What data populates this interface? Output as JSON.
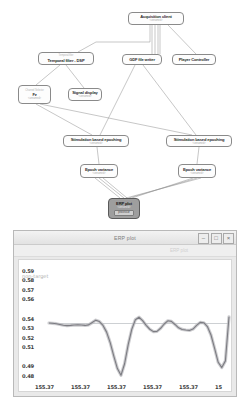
{
  "designer": {
    "nodes": [
      {
        "id": "acquisition-client",
        "sub_top": "",
        "title": "Acquisition client",
        "sub": "<unnamed>",
        "x": 128,
        "y": 12,
        "w": 56,
        "h": 13,
        "selected": false
      },
      {
        "id": "temporal-filter",
        "sub_top": "Temporal filter",
        "title": "Temporal filter - DSP",
        "sub": "",
        "x": 38,
        "y": 52,
        "w": 56,
        "h": 13,
        "selected": false
      },
      {
        "id": "gdf-file-writer",
        "sub_top": "",
        "title": "GDF file writer",
        "sub": "",
        "x": 122,
        "y": 54,
        "w": 40,
        "h": 11,
        "selected": false
      },
      {
        "id": "player-controller",
        "sub_top": "",
        "title": "Player Controller",
        "sub": "",
        "x": 172,
        "y": 54,
        "w": 44,
        "h": 11,
        "selected": false
      },
      {
        "id": "channel-selector",
        "sub_top": "Channel Selector",
        "title": "Fz",
        "sub": "<unnamed>",
        "x": 18,
        "y": 85,
        "w": 33,
        "h": 19,
        "selected": false
      },
      {
        "id": "signal-display",
        "sub_top": "",
        "title": "Signal display",
        "sub": "<unnamed>",
        "x": 68,
        "y": 88,
        "w": 34,
        "h": 13,
        "selected": false
      },
      {
        "id": "stim-epoching-left",
        "sub_top": "",
        "title": "Stimulation based epoching",
        "sub": "<unnamed>",
        "x": 63,
        "y": 135,
        "w": 66,
        "h": 12,
        "selected": false
      },
      {
        "id": "stim-epoching-right",
        "sub_top": "",
        "title": "Stimulation based epoching",
        "sub": "<unnamed>",
        "x": 166,
        "y": 135,
        "w": 66,
        "h": 12,
        "selected": false
      },
      {
        "id": "epoch-variance-left",
        "sub_top": "",
        "title": "Epoch variance",
        "sub": "<unnamed>",
        "x": 80,
        "y": 164,
        "w": 38,
        "h": 14,
        "selected": false
      },
      {
        "id": "epoch-variance-right",
        "sub_top": "",
        "title": "Epoch variance",
        "sub": "<unnamed>",
        "x": 178,
        "y": 164,
        "w": 38,
        "h": 14,
        "selected": false
      },
      {
        "id": "erp-plot-node",
        "sub_top": "",
        "title": "ERP plot",
        "sub": "<unnamed>",
        "chip": "processor",
        "x": 108,
        "y": 198,
        "w": 32,
        "h": 21,
        "selected": true
      }
    ]
  },
  "erp_window": {
    "title": "ERP plot",
    "tab_label": "ERP plot",
    "buttons": {
      "minimize": "–",
      "maximize": "□",
      "close": "×"
    }
  },
  "chart_data": {
    "type": "line",
    "title": "ERP plot",
    "xlabel": "",
    "ylabel": "",
    "legend": [
      "non-target"
    ],
    "legend_position": "top-left",
    "grid": false,
    "yticks": [
      "0.59",
      "0.58",
      "0.57",
      "0.56",
      "0.54",
      "0.53",
      "0.52",
      "0.51",
      "0.49",
      "0.48"
    ],
    "ytick_values": [
      0.59,
      0.58,
      0.57,
      0.56,
      0.54,
      0.53,
      0.52,
      0.51,
      0.49,
      0.48
    ],
    "ylim": [
      0.475,
      0.595
    ],
    "xticks": [
      "155.37",
      "155.37",
      "155.37",
      "155.37",
      "155.37",
      "15"
    ],
    "xtick_values": [
      155.37,
      155.37,
      155.37,
      155.37,
      155.37,
      155.37
    ],
    "baseline": 0.535,
    "series": [
      {
        "name": "non-target",
        "x": [
          0,
          2,
          4,
          6,
          8,
          10,
          12,
          14,
          16,
          18,
          20,
          22,
          24,
          26,
          28,
          30,
          32,
          34,
          36,
          38,
          40,
          42,
          44,
          46,
          48,
          50,
          52,
          54,
          56,
          58,
          60,
          62,
          64,
          66,
          68,
          70,
          72,
          74,
          76,
          78,
          80,
          82,
          84,
          86,
          88,
          90,
          92,
          94,
          96,
          98,
          100
        ],
        "values": [
          0.5355,
          0.5352,
          0.5348,
          0.534,
          0.5332,
          0.5328,
          0.533,
          0.5334,
          0.5336,
          0.5334,
          0.533,
          0.5336,
          0.536,
          0.5385,
          0.537,
          0.533,
          0.526,
          0.515,
          0.501,
          0.488,
          0.481,
          0.493,
          0.513,
          0.529,
          0.539,
          0.5415,
          0.538,
          0.533,
          0.529,
          0.5265,
          0.5268,
          0.53,
          0.5345,
          0.5378,
          0.5372,
          0.534,
          0.5305,
          0.5288,
          0.5282,
          0.5278,
          0.5292,
          0.533,
          0.5362,
          0.5358,
          0.5318,
          0.523,
          0.509,
          0.4945,
          0.489,
          0.496,
          0.542
        ]
      }
    ]
  }
}
